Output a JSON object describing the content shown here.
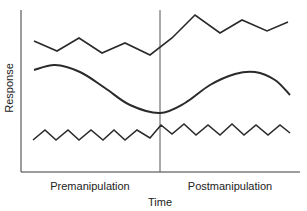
{
  "chart_data": {
    "type": "line",
    "title": "",
    "xlabel": "Time",
    "ylabel": "Response",
    "x_phase_labels": [
      "Premanipulation",
      "Postmanipulation"
    ],
    "divider": {
      "label": "manipulation point",
      "x": 160
    },
    "grid": false,
    "legend": null,
    "series": [
      {
        "name": "Top zigzag (level shift upward after manipulation)",
        "points": [
          [
            34,
            41
          ],
          [
            57,
            51
          ],
          [
            79,
            38
          ],
          [
            102,
            53
          ],
          [
            125,
            43
          ],
          [
            150,
            55
          ],
          [
            172,
            38
          ],
          [
            195,
            15
          ],
          [
            220,
            33
          ],
          [
            242,
            20
          ],
          [
            267,
            31
          ],
          [
            288,
            22
          ]
        ]
      },
      {
        "name": "Smooth cyclical curve",
        "points": [
          [
            34,
            70
          ],
          [
            55,
            65
          ],
          [
            80,
            72
          ],
          [
            105,
            88
          ],
          [
            130,
            105
          ],
          [
            160,
            113
          ],
          [
            185,
            103
          ],
          [
            210,
            85
          ],
          [
            235,
            74
          ],
          [
            255,
            72
          ],
          [
            275,
            80
          ],
          [
            290,
            95
          ]
        ]
      },
      {
        "name": "Bottom zigzag (stable oscillation)",
        "points": [
          [
            33,
            140
          ],
          [
            45,
            130
          ],
          [
            56,
            140
          ],
          [
            68,
            130
          ],
          [
            79,
            140
          ],
          [
            91,
            130
          ],
          [
            103,
            140
          ],
          [
            114,
            130
          ],
          [
            125,
            140
          ],
          [
            137,
            130
          ],
          [
            150,
            138
          ],
          [
            161,
            125
          ],
          [
            172,
            134
          ],
          [
            184,
            124
          ],
          [
            196,
            135
          ],
          [
            208,
            125
          ],
          [
            220,
            135
          ],
          [
            232,
            124
          ],
          [
            244,
            135
          ],
          [
            256,
            125
          ],
          [
            268,
            135
          ],
          [
            280,
            125
          ],
          [
            290,
            133
          ]
        ]
      }
    ],
    "note": "Values are pixel-space approximations; axes have no numeric ticks."
  },
  "labels": {
    "ylabel": "Response",
    "xlabel": "Time",
    "pre": "Premanipulation",
    "post": "Postmanipulation"
  }
}
